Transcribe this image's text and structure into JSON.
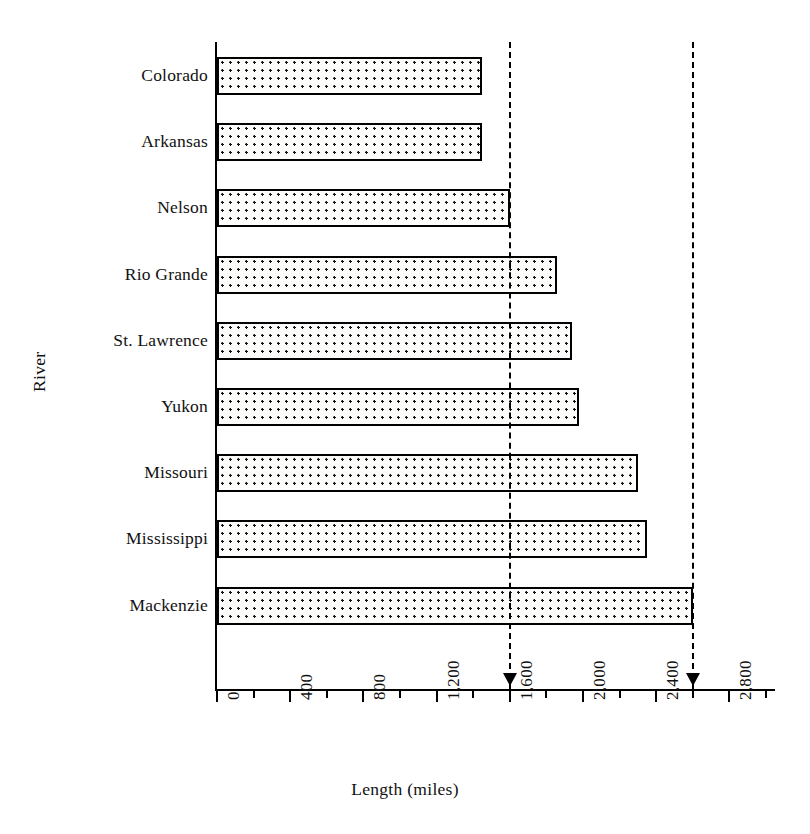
{
  "chart_data": {
    "type": "bar",
    "orientation": "horizontal",
    "title": "",
    "xlabel": "Length (miles)",
    "ylabel": "River",
    "categories": [
      "Colorado",
      "Arkansas",
      "Nelson",
      "Rio Grande",
      "St. Lawrence",
      "Yukon",
      "Missouri",
      "Mississippi",
      "Mackenzie"
    ],
    "values": [
      1450,
      1450,
      1600,
      1860,
      1940,
      1980,
      2300,
      2350,
      2600
    ],
    "xlim": [
      0,
      3060
    ],
    "xticks": [
      0,
      400,
      800,
      1200,
      1600,
      2000,
      2400,
      2800
    ],
    "xtick_labels": [
      "0",
      "400",
      "800",
      "1,200",
      "1,600",
      "2,000",
      "2,400",
      "2,800"
    ],
    "minor_xticks": [
      200,
      600,
      1000,
      1400,
      1800,
      2200,
      2600,
      3000
    ],
    "grid": false,
    "legend": null,
    "reference_lines": [
      {
        "value": 1600,
        "style": "dashed",
        "marker": "down-arrow"
      },
      {
        "value": 2600,
        "style": "dashed",
        "marker": "down-arrow"
      }
    ],
    "bar_fill": "dotted-pattern",
    "bar_edge_color": "#000000",
    "bar_face_color": "#fdfdfb"
  }
}
